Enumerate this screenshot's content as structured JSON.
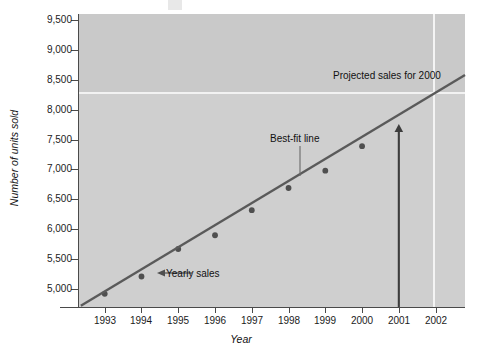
{
  "chart_data": {
    "type": "scatter",
    "title": "",
    "xlabel": "Year",
    "ylabel": "Number of units sold",
    "xlim": [
      1992.3,
      2002.8
    ],
    "ylim": [
      4700,
      9600
    ],
    "grid": false,
    "legend": "none",
    "x_ticks": [
      "1993",
      "1994",
      "1995",
      "1996",
      "1997",
      "1998",
      "1999",
      "2000",
      "2001",
      "2002"
    ],
    "y_ticks": [
      "5,000",
      "5,500",
      "6,000",
      "6,500",
      "7,000",
      "7,500",
      "8,000",
      "8,500",
      "9,000",
      "9,500"
    ],
    "series": [
      {
        "name": "Yearly sales",
        "type": "scatter",
        "color": "#4f4f4f",
        "x": [
          1993,
          1994,
          1995,
          1996,
          1997,
          1998,
          1999,
          2000
        ],
        "values": [
          4920,
          5210,
          5670,
          5900,
          6320,
          6690,
          6980,
          7390
        ]
      },
      {
        "name": "Best-fit line",
        "type": "line",
        "color": "#5a5a5a",
        "x": [
          1992.35,
          2002.8
        ],
        "values": [
          4720,
          8580
        ]
      }
    ],
    "annotations": [
      {
        "name": "projected-sales",
        "text": "Projected sales for 2000",
        "x": 2000.2,
        "y": 8450
      },
      {
        "name": "best-fit-line",
        "text": "Best-fit line",
        "x": 1998.0,
        "y": 7260
      },
      {
        "name": "yearly-sales",
        "text": "Yearly sales",
        "x": 1995.5,
        "y": 5190
      }
    ],
    "marker_arrow": {
      "name": "projection-arrow",
      "at_x": 2001,
      "from_y": 4700,
      "to_y": 7760,
      "color": "#3d3d3d"
    }
  },
  "axes": {
    "y_label": "Number of units sold",
    "x_label": "Year"
  }
}
